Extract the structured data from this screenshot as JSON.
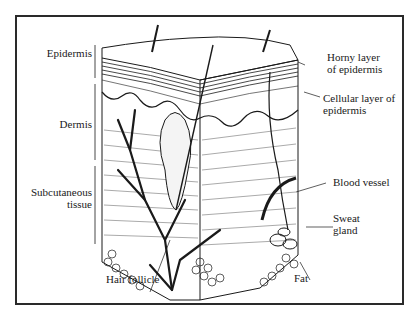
{
  "diagram": {
    "left_labels": {
      "epidermis": "Epidermis",
      "dermis": "Dermis",
      "subcutaneous_line1": "Subcutaneous",
      "subcutaneous_line2": "tissue"
    },
    "right_labels": {
      "horny_line1": "Horny layer",
      "horny_line2": "of epidermis",
      "cellular_line1": "Cellular layer of",
      "cellular_line2": "epidermis",
      "blood_vessel": "Blood vessel",
      "sweat_line1": "Sweat",
      "sweat_line2": "gland",
      "fat": "Fat"
    },
    "bottom_labels": {
      "hair_follicle": "Hair follicle"
    },
    "colors": {
      "ink": "#1a1a1a",
      "paper": "#ffffff",
      "border": "#2a2a2a"
    }
  }
}
